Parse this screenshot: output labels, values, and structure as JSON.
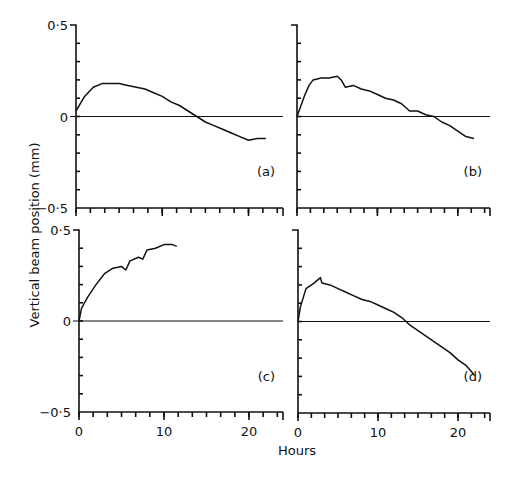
{
  "chart_data": [
    {
      "type": "line",
      "panel": "(a)",
      "xlabel": "Hours",
      "ylabel": "Vertical beam position (mm)",
      "xlim": [
        0,
        24
      ],
      "ylim": [
        -0.5,
        0.5
      ],
      "x": [
        0,
        0.5,
        1,
        2,
        3,
        4,
        5,
        6,
        7,
        8,
        9,
        10,
        11,
        12,
        13,
        14,
        15,
        16,
        17,
        18,
        19,
        20,
        21,
        22
      ],
      "y": [
        0.03,
        0.07,
        0.11,
        0.16,
        0.18,
        0.18,
        0.18,
        0.17,
        0.16,
        0.15,
        0.13,
        0.11,
        0.08,
        0.06,
        0.03,
        0.0,
        -0.03,
        -0.05,
        -0.07,
        -0.09,
        -0.11,
        -0.13,
        -0.12,
        -0.12
      ]
    },
    {
      "type": "line",
      "panel": "(b)",
      "xlabel": "Hours",
      "ylabel": "Vertical beam position (mm)",
      "xlim": [
        0,
        24
      ],
      "ylim": [
        -0.5,
        0.5
      ],
      "x": [
        0,
        1,
        1.5,
        2,
        3,
        4,
        5,
        5.5,
        6,
        7,
        8,
        9,
        10,
        11,
        12,
        13,
        14,
        15,
        16,
        17,
        18,
        19,
        20,
        21,
        22
      ],
      "y": [
        0.0,
        0.12,
        0.17,
        0.2,
        0.21,
        0.21,
        0.22,
        0.2,
        0.16,
        0.17,
        0.15,
        0.14,
        0.12,
        0.1,
        0.09,
        0.07,
        0.03,
        0.03,
        0.01,
        0.0,
        -0.03,
        -0.05,
        -0.08,
        -0.11,
        -0.12
      ]
    },
    {
      "type": "line",
      "panel": "(c)",
      "xlabel": "Hours",
      "ylabel": "Vertical beam position (mm)",
      "xlim": [
        0,
        24
      ],
      "ylim": [
        -0.5,
        0.5
      ],
      "x": [
        0,
        0.3,
        1,
        2,
        3,
        4,
        5,
        5.5,
        6,
        7,
        7.5,
        8,
        9,
        10,
        11,
        11.5
      ],
      "y": [
        0.0,
        0.07,
        0.13,
        0.2,
        0.26,
        0.29,
        0.3,
        0.28,
        0.33,
        0.35,
        0.34,
        0.39,
        0.4,
        0.42,
        0.42,
        0.41
      ]
    },
    {
      "type": "line",
      "panel": "(d)",
      "xlabel": "Hours",
      "ylabel": "Vertical beam position (mm)",
      "xlim": [
        0,
        24
      ],
      "ylim": [
        -0.5,
        0.5
      ],
      "x": [
        0,
        0.3,
        1,
        2,
        2.8,
        3,
        4,
        5,
        6,
        7,
        8,
        9,
        10,
        11,
        12,
        13,
        14,
        15,
        16,
        17,
        18,
        19,
        20,
        21,
        22
      ],
      "y": [
        0.0,
        0.08,
        0.18,
        0.21,
        0.24,
        0.21,
        0.2,
        0.18,
        0.16,
        0.14,
        0.12,
        0.11,
        0.09,
        0.07,
        0.05,
        0.02,
        -0.02,
        -0.05,
        -0.08,
        -0.11,
        -0.14,
        -0.17,
        -0.21,
        -0.24,
        -0.29
      ]
    }
  ],
  "labels": {
    "ylabel": "Vertical beam position (mm)",
    "xlabel": "Hours",
    "y_top": "0·5",
    "y_zero": "0",
    "y_bottom": "−0·5",
    "x_ticks": [
      "0",
      "10",
      "20"
    ],
    "panels": [
      "(a)",
      "(b)",
      "(c)",
      "(d)"
    ]
  }
}
